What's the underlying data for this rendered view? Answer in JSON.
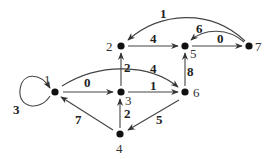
{
  "graph": {
    "type": "directed-weighted",
    "nodes": [
      {
        "id": "1",
        "label": "1",
        "x": 55,
        "y": 92,
        "lx": 44,
        "ly": 84
      },
      {
        "id": "2",
        "label": "2",
        "x": 121,
        "y": 46,
        "lx": 106,
        "ly": 51
      },
      {
        "id": "3",
        "label": "3",
        "x": 121,
        "y": 92,
        "lx": 125,
        "ly": 105
      },
      {
        "id": "4",
        "label": "4",
        "x": 120,
        "y": 134,
        "lx": 116,
        "ly": 153
      },
      {
        "id": "5",
        "label": "5",
        "x": 185,
        "y": 46,
        "lx": 190,
        "ly": 58
      },
      {
        "id": "6",
        "label": "6",
        "x": 185,
        "y": 92,
        "lx": 193,
        "ly": 97
      },
      {
        "id": "7",
        "label": "7",
        "x": 249,
        "y": 46,
        "lx": 255,
        "ly": 51
      }
    ],
    "edges": [
      {
        "from": "1",
        "to": "1",
        "weight": "3",
        "lx": 13,
        "ly": 114
      },
      {
        "from": "1",
        "to": "3",
        "weight": "0",
        "lx": 84,
        "ly": 87
      },
      {
        "from": "1",
        "to": "6",
        "weight": "4",
        "lx": 150,
        "ly": 73
      },
      {
        "from": "3",
        "to": "2",
        "weight": "2",
        "lx": 124,
        "ly": 72
      },
      {
        "from": "3",
        "to": "6",
        "weight": "1",
        "lx": 150,
        "ly": 90
      },
      {
        "from": "2",
        "to": "5",
        "weight": "4",
        "lx": 150,
        "ly": 43
      },
      {
        "from": "6",
        "to": "5",
        "weight": "8",
        "lx": 187,
        "ly": 76
      },
      {
        "from": "5",
        "to": "7",
        "weight": "0",
        "lx": 217,
        "ly": 43
      },
      {
        "from": "7",
        "to": "5",
        "weight": "6",
        "lx": 196,
        "ly": 33
      },
      {
        "from": "7",
        "to": "2",
        "weight": "1",
        "lx": 160,
        "ly": 18
      },
      {
        "from": "4",
        "to": "1",
        "weight": "7",
        "lx": 75,
        "ly": 124
      },
      {
        "from": "4",
        "to": "3",
        "weight": "2",
        "lx": 124,
        "ly": 118
      },
      {
        "from": "6",
        "to": "4",
        "weight": "5",
        "lx": 156,
        "ly": 124
      }
    ]
  }
}
